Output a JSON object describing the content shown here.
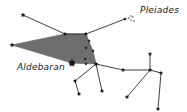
{
  "diagram": {
    "labels": {
      "pleiades": "Pleiades",
      "aldebaran": "Aldebaran"
    },
    "colors": {
      "background": "#ffffff",
      "line": "#2a2a2a",
      "fill": "#6e6e6e",
      "star": "#1a1a1a"
    },
    "stars": [
      {
        "id": "s1",
        "x": 23,
        "y": 15,
        "r": 2.6
      },
      {
        "id": "s2",
        "x": 12,
        "y": 45,
        "r": 2.6
      },
      {
        "id": "s3",
        "x": 65,
        "y": 34,
        "r": 2.4
      },
      {
        "id": "s4",
        "x": 86,
        "y": 34,
        "r": 2.4
      },
      {
        "id": "pleiades",
        "x": 125,
        "y": 19,
        "r": 2.0
      },
      {
        "id": "h1",
        "x": 89,
        "y": 41,
        "r": 1.8
      },
      {
        "id": "h2",
        "x": 86,
        "y": 48,
        "r": 1.8
      },
      {
        "id": "h3",
        "x": 93,
        "y": 51,
        "r": 1.8
      },
      {
        "id": "h4",
        "x": 85,
        "y": 59,
        "r": 1.8
      },
      {
        "id": "h5",
        "x": 86,
        "y": 64,
        "r": 1.8
      },
      {
        "id": "aldebaran",
        "x": 72,
        "y": 63,
        "r": 4.2
      },
      {
        "id": "j1",
        "x": 96,
        "y": 64,
        "r": 2.6
      },
      {
        "id": "s5",
        "x": 123,
        "y": 70,
        "r": 2.4
      },
      {
        "id": "s6",
        "x": 150,
        "y": 70,
        "r": 2.4
      },
      {
        "id": "s7",
        "x": 161,
        "y": 73,
        "r": 2.4
      },
      {
        "id": "s8",
        "x": 150,
        "y": 54,
        "r": 2.4
      },
      {
        "id": "s9",
        "x": 75,
        "y": 81,
        "r": 2.4
      },
      {
        "id": "s10",
        "x": 79,
        "y": 94,
        "r": 2.4
      },
      {
        "id": "s11",
        "x": 102,
        "y": 91,
        "r": 2.4
      },
      {
        "id": "s12",
        "x": 127,
        "y": 97,
        "r": 2.4
      },
      {
        "id": "s13",
        "x": 158,
        "y": 109,
        "r": 2.4
      }
    ],
    "lines": [
      [
        "s1",
        "s3"
      ],
      [
        "s3",
        "s4"
      ],
      [
        "s4",
        "pleiades"
      ],
      [
        "j1",
        "s5"
      ],
      [
        "s5",
        "s6"
      ],
      [
        "s6",
        "s7"
      ],
      [
        "s6",
        "s8"
      ],
      [
        "s6",
        "s12"
      ],
      [
        "s7",
        "s13"
      ],
      [
        "j1",
        "s9"
      ],
      [
        "s9",
        "s10"
      ],
      [
        "j1",
        "s11"
      ]
    ],
    "polygon": [
      "s2",
      "s3",
      "s4",
      "h3",
      "j1",
      "aldebaran"
    ],
    "pleiades_dots": [
      [
        129,
        18
      ],
      [
        131,
        20
      ],
      [
        133,
        17
      ],
      [
        131,
        16
      ],
      [
        134,
        21
      ]
    ]
  }
}
